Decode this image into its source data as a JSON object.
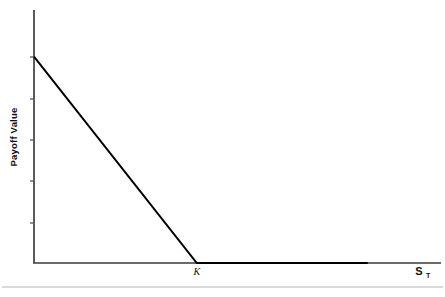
{
  "chart_data": {
    "type": "line",
    "title": "",
    "subtitle": "",
    "xlabel": "S_T",
    "ylabel": "Payoff Value",
    "xlabel_display": "S",
    "xlabel_subscript": "T",
    "grid": false,
    "legend": null,
    "axis_color": "#222222",
    "line_color": "#000000",
    "baseline_rule_color": "#b0b0b0",
    "background": "#ffffff",
    "xlim": [
      0,
      5
    ],
    "ylim": [
      0,
      5
    ],
    "x_tick_labels": [
      "K"
    ],
    "x_tick_values": [
      2
    ],
    "y_tick_count": 5,
    "y_tick_labels": [
      "",
      "",
      "",
      "",
      ""
    ],
    "annotations": [
      {
        "name": "strike-label",
        "text": "K",
        "x": 2,
        "y": 0
      },
      {
        "name": "x-axis-label",
        "text": "S",
        "subscript": "T",
        "x": 4.8,
        "y": 0
      },
      {
        "name": "y-axis-label",
        "text": "Payoff Value",
        "rotation": -90
      }
    ],
    "series": [
      {
        "name": "Long Put Payoff",
        "description": "Payoff of a long put option at expiry: max(K - S_T, 0)",
        "points": [
          {
            "x": 0,
            "y": 4.08
          },
          {
            "x": 2,
            "y": 0
          },
          {
            "x": 4.1,
            "y": 0
          }
        ],
        "color": "#000000",
        "width": 2
      }
    ]
  },
  "figure": {
    "caption": "",
    "footer_rule": true
  }
}
